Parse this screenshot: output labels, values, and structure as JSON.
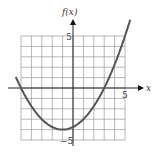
{
  "chart_data": {
    "type": "line",
    "title": "",
    "xlabel": "x",
    "ylabel": "f(x)",
    "xlim": [
      -5,
      5
    ],
    "ylim": [
      -5,
      5
    ],
    "grid": true,
    "tick_labels": {
      "x": [
        "5"
      ],
      "y": [
        "5",
        "-5"
      ]
    },
    "series": [
      {
        "name": "f(x)",
        "formula": "0.25*(x+1)^2 - 4",
        "x": [
          -5.5,
          -5,
          -4,
          -3,
          -2,
          -1,
          0,
          1,
          2,
          3,
          4,
          5,
          5.5
        ],
        "y": [
          1.06,
          0,
          -1.75,
          -3,
          -3.75,
          -4,
          -3.75,
          -3,
          -1.75,
          0,
          2.25,
          5,
          6.06
        ]
      }
    ]
  },
  "labels": {
    "y_axis": "f(x)",
    "x_axis": "x",
    "x_tick": "5",
    "y_tick_top": "5",
    "y_tick_bottom": "−5"
  }
}
